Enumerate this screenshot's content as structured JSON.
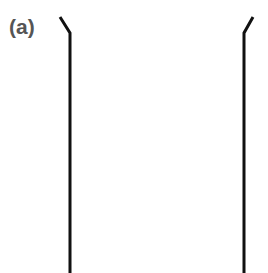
{
  "figure": {
    "panel_label": "(a)",
    "label_color": "#555555",
    "background_color": "#ffffff",
    "width": 268,
    "height": 273
  },
  "chart_data": {
    "type": "line",
    "title": "(a)",
    "subtitle": "",
    "xlabel": "",
    "ylabel": "",
    "xlim": [
      0,
      268
    ],
    "ylim": [
      0,
      273
    ],
    "grid": false,
    "legend": "none",
    "annotations": [
      {
        "text": "(a)",
        "x": 10,
        "y": 31,
        "color": "#555555",
        "bold": true,
        "fontsize": 21
      }
    ],
    "series": [
      {
        "name": "left-wall",
        "color": "#111111",
        "linewidth": 3,
        "x": [
          60,
          70,
          70
        ],
        "y": [
          17,
          33,
          273
        ]
      },
      {
        "name": "right-wall",
        "color": "#111111",
        "linewidth": 3,
        "x": [
          253,
          244,
          244
        ],
        "y": [
          17,
          33,
          273
        ]
      }
    ]
  },
  "strokes": {
    "color": "#111111",
    "width": 3,
    "left_path": "M 60 17 L 70 33 L 70 273",
    "right_path": "M 253 17 L 244 33 L 244 273"
  }
}
